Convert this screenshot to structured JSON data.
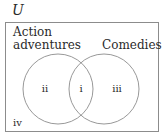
{
  "diagram": {
    "universal_label": "U",
    "sets": [
      {
        "name": "set-action-adventures",
        "label_line1": "Action",
        "label_line2": "adventures"
      },
      {
        "name": "set-comedies",
        "label": "Comedies"
      }
    ],
    "regions": {
      "i": "i",
      "ii": "ii",
      "iii": "iii",
      "iv": "iv"
    },
    "colors": {
      "stroke": "#8c8c8c",
      "text": "#2a2a2a"
    }
  }
}
